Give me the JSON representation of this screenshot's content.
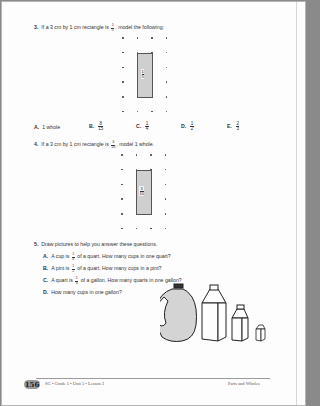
{
  "questions": [
    {
      "number": "3.",
      "text_before": "If a 3 cm by 1 cm rectangle is",
      "fraction": {
        "num": "1",
        "den": "5"
      },
      "text_after": ", model the following:",
      "diagram": {
        "rect_label": {
          "num": "1",
          "den": "5"
        },
        "grid_cols": 4,
        "grid_rows": 6
      },
      "choices": [
        {
          "letter": "A.",
          "text": "1 whole"
        },
        {
          "letter": "B.",
          "fraction": {
            "num": "8",
            "den": "15"
          }
        },
        {
          "letter": "C.",
          "fraction": {
            "num": "1",
            "den": "4"
          }
        },
        {
          "letter": "D.",
          "fraction": {
            "num": "1",
            "den": "2"
          }
        },
        {
          "letter": "E.",
          "fraction": {
            "num": "2",
            "den": "3"
          }
        }
      ]
    },
    {
      "number": "4.",
      "text_before": "If a 3 cm by 1 cm rectangle is",
      "fraction": {
        "num": "3",
        "den": "10"
      },
      "text_after": ", model 1 whole.",
      "diagram": {
        "rect_label": {
          "num": "3",
          "den": "10"
        },
        "grid_cols": 4,
        "grid_rows": 6
      }
    },
    {
      "number": "5.",
      "text": "Draw pictures to help you answer these questions.",
      "parts": [
        {
          "letter": "A.",
          "pre": "A cup is",
          "fraction": {
            "num": "1",
            "den": "4"
          },
          "post": "of a quart. How many cups in one quart?"
        },
        {
          "letter": "B.",
          "pre": "A pint is",
          "fraction": {
            "num": "1",
            "den": "2"
          },
          "post": "of a quart. How many cups in a pint?"
        },
        {
          "letter": "C.",
          "pre": "A quart is",
          "fraction": {
            "num": "1",
            "den": "4"
          },
          "post": "of a gallon. How many quarts in one gallon?"
        },
        {
          "letter": "D.",
          "text": "How many cups in one gallon?"
        }
      ],
      "illustration": [
        "gallon-jug",
        "half-gallon-carton",
        "quart-carton",
        "cup-carton"
      ]
    }
  ],
  "footer": {
    "page_number": "156",
    "left": "SG • Grade 5 • Unit 5 • Lesson 3",
    "right": "Parts and Wholes"
  }
}
